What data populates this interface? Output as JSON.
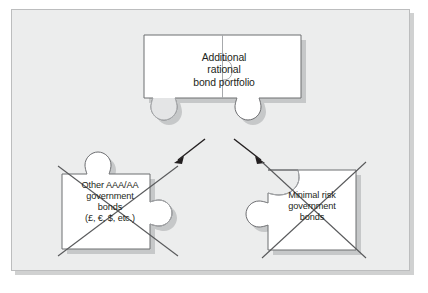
{
  "figure": {
    "type": "jigsaw-puzzle-diagram",
    "background_color": "#ffffff",
    "panel_color": "#eceded",
    "panel_border_color": "#bcbdbe",
    "piece_fill": "#ffffff",
    "piece_outline": "#6d6e71",
    "piece_shadow": "#a7a9ac",
    "divider_color": "#a7a9ac",
    "cross_color": "#58595b",
    "arrow_color": "#231f20",
    "text_color": "#231f20"
  },
  "pieces": {
    "top": {
      "name": "Additional rational bond portfolio",
      "label": "Additional\nrational\nbond portfolio",
      "crossed_out": false,
      "halves": 2
    },
    "bottom_left": {
      "name": "Other AAA/AA government bonds",
      "label": "Other AAA/AA\ngovernment\nbonds\n(£, €, $, etc.)",
      "crossed_out": true
    },
    "bottom_right": {
      "name": "Minimal risk government bonds",
      "label": "Minimal risk\ngovernment\nbonds",
      "crossed_out": true
    }
  },
  "arrows": [
    {
      "name": "arrow-to-left-piece",
      "direction": "down-left"
    },
    {
      "name": "arrow-to-right-piece",
      "direction": "down-right"
    }
  ]
}
